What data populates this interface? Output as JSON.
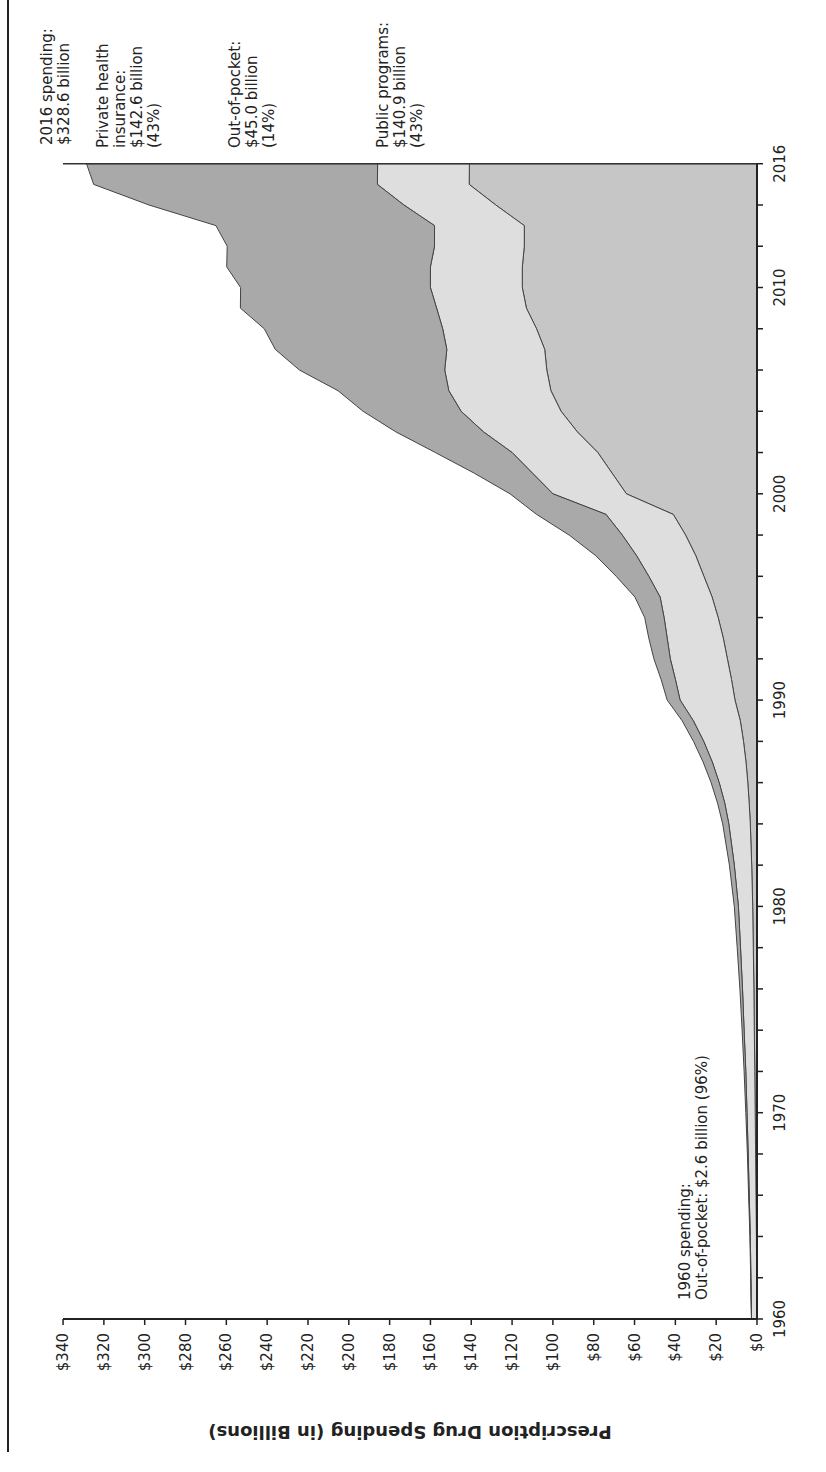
{
  "chart_data": {
    "type": "area",
    "stacked": true,
    "orientation_note": "figure rotated 90deg counter-clockwise on page",
    "title": "",
    "xlabel": "",
    "ylabel": "Prescription Drug Spending (in Billions)",
    "xlim": [
      1960,
      2016
    ],
    "ylim": [
      0,
      340
    ],
    "x_ticks": [
      "1960",
      "1970",
      "1980",
      "1990",
      "2000",
      "2010",
      "2016"
    ],
    "y_ticks": [
      "$0",
      "$20",
      "$40",
      "$60",
      "$80",
      "$100",
      "$120",
      "$140",
      "$160",
      "$180",
      "$200",
      "$220",
      "$240",
      "$260",
      "$280",
      "$300",
      "$320",
      "$340"
    ],
    "x": [
      1960,
      1962,
      1964,
      1966,
      1968,
      1970,
      1972,
      1974,
      1976,
      1978,
      1980,
      1982,
      1984,
      1985,
      1986,
      1987,
      1988,
      1989,
      1990,
      1991,
      1992,
      1993,
      1994,
      1995,
      1996,
      1997,
      1998,
      1999,
      2000,
      2001,
      2002,
      2003,
      2004,
      2005,
      2006,
      2007,
      2008,
      2009,
      2010,
      2011,
      2012,
      2013,
      2014,
      2015,
      2016
    ],
    "series": [
      {
        "name": "Public programs",
        "color": "#c6c6c6",
        "values": [
          0.1,
          0.2,
          0.3,
          0.5,
          0.7,
          0.9,
          1.1,
          1.3,
          1.5,
          1.8,
          2.1,
          2.6,
          3.3,
          3.8,
          4.5,
          5.4,
          6.6,
          8.2,
          10.8,
          12.5,
          14.5,
          16.5,
          19.0,
          22.0,
          26,
          30,
          35,
          41,
          64,
          71,
          78,
          88,
          96,
          101,
          103,
          104,
          108,
          113,
          115,
          115,
          114,
          114,
          128,
          141,
          140.9
        ]
      },
      {
        "name": "Out-of-pocket",
        "color": "#dedede",
        "values": [
          2.6,
          2.8,
          3.0,
          3.3,
          3.6,
          4.0,
          4.4,
          5.0,
          5.6,
          6.3,
          7.0,
          8.5,
          10.5,
          12.0,
          14.0,
          16.5,
          19.5,
          23.0,
          26.9,
          27.5,
          28.0,
          27.5,
          26.5,
          25.5,
          27,
          29,
          31,
          33,
          36,
          39,
          42,
          46,
          49,
          50,
          50,
          48,
          46,
          44,
          45,
          45,
          44,
          44,
          45,
          45,
          45.0
        ]
      },
      {
        "name": "Private health insurance",
        "color": "#a9a9a9",
        "values": [
          0.0,
          0.1,
          0.2,
          0.3,
          0.4,
          0.6,
          0.8,
          1.0,
          1.3,
          1.6,
          2.0,
          2.4,
          3.0,
          3.5,
          4.0,
          4.5,
          5.0,
          5.5,
          6.3,
          7.0,
          8.0,
          9.0,
          9.5,
          12.3,
          16,
          20,
          26,
          34,
          21,
          28.5,
          37.6,
          42.9,
          48,
          54.3,
          71.2,
          84,
          87.4,
          96.1,
          93,
          99.8,
          101.6,
          107.1,
          124.9,
          139.0,
          142.6
        ]
      }
    ],
    "totals": [
      2.7,
      3.1,
      3.5,
      4.1,
      4.7,
      5.5,
      6.3,
      7.3,
      8.4,
      9.7,
      11.1,
      13.5,
      16.8,
      19.3,
      22.5,
      26.4,
      31.1,
      36.7,
      44.0,
      47.0,
      50.5,
      53.0,
      55.0,
      59.8,
      69,
      79,
      92,
      108,
      121,
      138.5,
      157.6,
      176.9,
      193.0,
      205.3,
      224.2,
      236.0,
      241.4,
      253.1,
      253.0,
      259.8,
      259.6,
      265.1,
      297.9,
      325.0,
      328.6
    ],
    "annotations": [
      {
        "text": "2016 spending: $328.6 billion",
        "year": 2016
      },
      {
        "text": "Private health insurance: $142.6 billion (43%)",
        "year": 2016
      },
      {
        "text": "Out-of-pocket: $45.0 billion (14%)",
        "year": 2016
      },
      {
        "text": "Public programs: $140.9 billion (43%)",
        "year": 2016
      },
      {
        "text": "1960 spending: Out-of-pocket: $2.6 billion (96%)",
        "year": 1960
      }
    ],
    "grid": false,
    "legend": "none (direct labels)"
  },
  "labels": {
    "y_axis_title": "Prescription Drug Spending (in Billions)",
    "total_2016": [
      "2016 spending:",
      "$328.6 billion"
    ],
    "private_2016": [
      "Private health",
      "insurance:",
      "$142.6 billion",
      "(43%)"
    ],
    "oop_2016": [
      "Out-of-pocket:",
      "$45.0 billion",
      "(14%)"
    ],
    "public_2016": [
      "Public programs:",
      "$140.9 billion",
      "(43%)"
    ],
    "note_1960": [
      "1960 spending:",
      "Out-of-pocket: $2.6 billion (96%)"
    ]
  }
}
